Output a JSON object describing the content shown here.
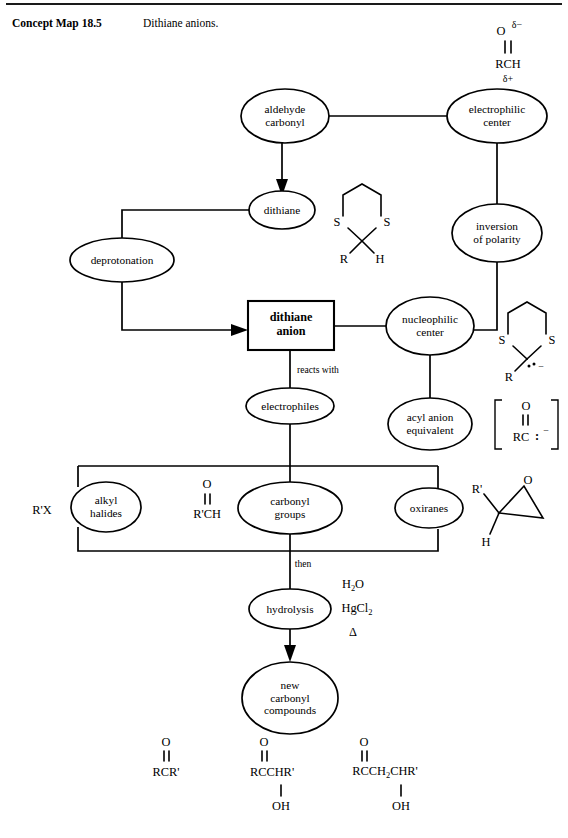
{
  "caption": {
    "label": "Concept Map 18.5",
    "text": "Dithiane anions."
  },
  "nodes": {
    "aldehyde_carbonyl": {
      "line1": "aldehyde",
      "line2": "carbonyl"
    },
    "electrophilic_center": {
      "line1": "electrophilic",
      "line2": "center"
    },
    "dithiane": {
      "line1": "dithiane"
    },
    "inversion_of_polarity": {
      "line1": "inversion",
      "line2": "of polarity"
    },
    "deprotonation": {
      "line1": "deprotonation"
    },
    "dithiane_anion": {
      "line1": "dithiane",
      "line2": "anion"
    },
    "nucleophilic_center": {
      "line1": "nucleophilic",
      "line2": "center"
    },
    "electrophiles": {
      "line1": "electrophiles"
    },
    "acyl_anion_equivalent": {
      "line1": "acyl anion",
      "line2": "equivalent"
    },
    "alkyl_halides": {
      "line1": "alkyl",
      "line2": "halides"
    },
    "carbonyl_groups": {
      "line1": "carbonyl",
      "line2": "groups"
    },
    "oxiranes": {
      "line1": "oxiranes"
    },
    "hydrolysis": {
      "line1": "hydrolysis"
    },
    "new_carbonyl_compounds": {
      "line1": "new",
      "line2": "carbonyl",
      "line3": "compounds"
    }
  },
  "edge_labels": {
    "reacts_with": "reacts with",
    "then": "then"
  },
  "structures": {
    "aldehyde_formula": {
      "oxygen": "O",
      "delta_minus": "δ−",
      "body": "RCH",
      "delta_plus": "δ+"
    },
    "dithiane_ring": {
      "s_left": "S",
      "s_right": "S",
      "sub_left": "R",
      "sub_right": "H"
    },
    "dithiane_anion_ring": {
      "s_left": "S",
      "s_right": "S",
      "sub_left": "R",
      "charge": "−"
    },
    "acyl_anion": {
      "oxygen": "O",
      "body": "RC",
      "charge": "−"
    },
    "alkyl_halide_formula": "R'X",
    "carbonyl_reagent": {
      "oxygen": "O",
      "body": "R'CH"
    },
    "oxirane": {
      "oxygen": "O",
      "sub_left": "R'",
      "sub_bottom": "H"
    }
  },
  "conditions": {
    "water": "H2O",
    "mercuric_chloride": "HgCl2",
    "heat": "Δ"
  },
  "products": [
    {
      "oxygen": "O",
      "body": "RCR'",
      "hydroxyl": ""
    },
    {
      "oxygen": "O",
      "body": "RCCHR'",
      "hydroxyl": "OH"
    },
    {
      "oxygen": "O",
      "body": "RCCH2CHR'",
      "hydroxyl": "OH"
    }
  ],
  "colors": {
    "ink": "#000000",
    "paper": "#ffffff"
  }
}
